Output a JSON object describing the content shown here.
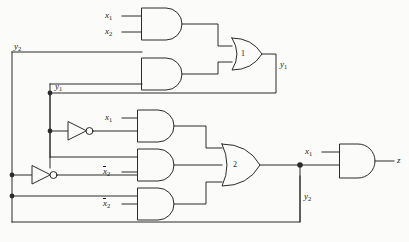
{
  "diagram": {
    "line_color": "#2b2b2b",
    "background": "#fbfbf9"
  },
  "signals": {
    "x1": "x",
    "x1_sub": "1",
    "x2": "x",
    "x2_sub": "2",
    "x2_bar": "x",
    "x2_bar_sub": "2",
    "y1": "y",
    "y1_sub": "1",
    "y2": "y",
    "y2_sub": "2",
    "z": "z"
  },
  "gates": [
    {
      "id": "and-1",
      "type": "AND",
      "number": "",
      "inputs": [
        "x1",
        "x2"
      ],
      "output": "to-or-1"
    },
    {
      "id": "and-2",
      "type": "AND",
      "number": "",
      "inputs": [
        "y2",
        "y1"
      ],
      "output": "to-or-1"
    },
    {
      "id": "or-1",
      "type": "OR",
      "number": "1",
      "inputs": [
        "and-1",
        "and-2"
      ],
      "output": "y1"
    },
    {
      "id": "and-3",
      "type": "AND",
      "number": "",
      "inputs": [
        "x1",
        "not-y1"
      ],
      "output": "to-or-2"
    },
    {
      "id": "and-4",
      "type": "AND",
      "number": "",
      "inputs": [
        "y1",
        "x2_bar"
      ],
      "output": "to-or-2"
    },
    {
      "id": "and-5",
      "type": "AND",
      "number": "",
      "inputs": [
        "y2",
        "x2_bar"
      ],
      "output": "to-or-2"
    },
    {
      "id": "or-2",
      "type": "OR",
      "number": "2",
      "inputs": [
        "and-3",
        "and-4",
        "and-5"
      ],
      "output": "y2"
    },
    {
      "id": "and-6",
      "type": "AND",
      "number": "",
      "inputs": [
        "x1",
        "y2"
      ],
      "output": "z"
    },
    {
      "id": "not-1",
      "type": "NOT",
      "number": "",
      "inputs": [
        "y1"
      ],
      "output": "not-y1"
    },
    {
      "id": "not-2",
      "type": "NOT",
      "number": "",
      "inputs": [
        "y2"
      ],
      "output": "not-y2"
    }
  ],
  "gate_labels": {
    "or1_number": "1",
    "or2_number": "2"
  }
}
